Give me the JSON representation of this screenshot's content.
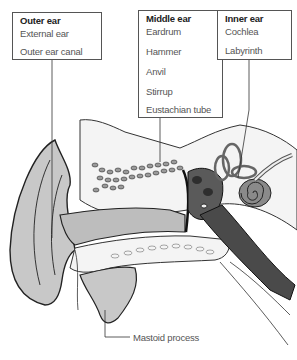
{
  "diagram": {
    "groups": [
      {
        "title": "Outer ear",
        "items": [
          "External ear",
          "Outer ear canal"
        ]
      },
      {
        "title": "Middle ear",
        "items": [
          "Eardrum",
          "Hammer",
          "Anvil",
          "Stirrup",
          "Eustachian tube"
        ]
      },
      {
        "title": "Inner ear",
        "items": [
          "Cochlea",
          "Labyrinth"
        ]
      }
    ],
    "callouts": [
      {
        "label": "Mastoid process"
      }
    ],
    "colors": {
      "outline": "#222222",
      "soft_tissue": "#c8c8c8",
      "bone": "#f2f2f2",
      "dark_structure": "#4a4a4a",
      "label_text": "#555555",
      "box_border": "#555555"
    }
  }
}
